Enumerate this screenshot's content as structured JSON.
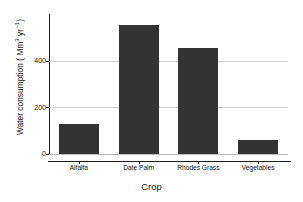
{
  "chart_data": {
    "type": "bar",
    "title": "",
    "categories": [
      "Alfalfa",
      "Date Palm",
      "Rhodes Grass",
      "Vegetables"
    ],
    "values": [
      128,
      552,
      453,
      60
    ],
    "xlabel": "Crop",
    "ylabel": "Water consumption ( Mm3 yr-1)",
    "ylabel_parts": {
      "prefix": "Water consumption ( Mm",
      "sup1": "3",
      "mid": " yr",
      "sup2": "−1",
      "suffix": ")"
    },
    "yticks": [
      0,
      200,
      400
    ],
    "ytick_labels": [
      "0",
      "200",
      "400"
    ],
    "ylim": [
      0,
      600
    ],
    "grid": "horizontal",
    "gridlines_at": [
      200,
      400
    ],
    "legend": "none",
    "bar_color": "#333333",
    "gridline_color": "#cfcfcf",
    "axis_color": "#1a1a1a",
    "background": "#ffffff"
  }
}
